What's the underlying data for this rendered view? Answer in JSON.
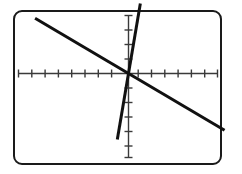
{
  "domain": "Chart",
  "frame": {
    "label": "graphing-calculator-screen",
    "border_color": "#1a1a1a",
    "background_color": "#ffffff",
    "corner_radius_px": 9
  },
  "chart_data": {
    "type": "line",
    "title": "",
    "subtitle": "",
    "xlabel": "",
    "ylabel": "",
    "grid": false,
    "legend": "none",
    "axis_color": "#333333",
    "line_color": "#111111",
    "xlim": [
      -7.6,
      7.6
    ],
    "ylim": [
      -4.6,
      4.6
    ],
    "x_ticks": [
      -7,
      -6,
      -5,
      -4,
      -3,
      -2,
      -1,
      1,
      2,
      3,
      4,
      5,
      6,
      7
    ],
    "y_ticks": [
      -4,
      -3,
      -2,
      -1,
      1,
      2,
      3,
      4
    ],
    "x_tick_count": 14,
    "y_tick_count": 8,
    "intersection": [
      0,
      0
    ],
    "series": [
      {
        "name": "descending-line",
        "slope": -0.5,
        "intercept": 0,
        "x": [
          -7.1,
          7.3
        ],
        "y": [
          3.55,
          -3.65
        ],
        "style": "solid",
        "width_px": 3
      },
      {
        "name": "steep-ascending-line",
        "slope": 5.0,
        "intercept": 0,
        "x": [
          -0.85,
          0.9
        ],
        "y": [
          -4.25,
          4.5
        ],
        "style": "solid",
        "width_px": 3
      }
    ]
  },
  "a11y": {
    "description": "Graphing calculator screen showing two intersecting straight lines crossing at the origin on a tick-marked coordinate plane"
  }
}
